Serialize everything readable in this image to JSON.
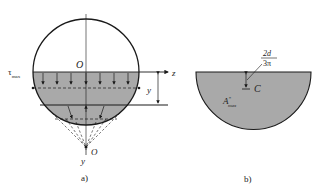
{
  "figure_a": {
    "caption": "a)",
    "labels": {
      "center": "O",
      "tau": "τ",
      "tau_sub": "max",
      "z_axis": "z",
      "y_dim": "y",
      "pole": "O",
      "y_axis": "y"
    }
  },
  "figure_b": {
    "caption": "b)",
    "labels": {
      "centroid": "C",
      "area": "A",
      "area_sup": "*",
      "area_sub": "max",
      "offset_num": "2d",
      "offset_den": "3π"
    }
  },
  "colors": {
    "fill": "#a9a9a9",
    "stroke": "#1a1a1a",
    "background": "#ffffff"
  }
}
